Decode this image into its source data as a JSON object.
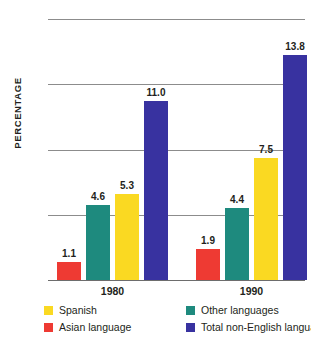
{
  "chart_data": {
    "type": "bar",
    "title": "",
    "subtitle": "",
    "xlabel": "",
    "ylabel": "PERCENTAGE",
    "ylim": [
      0,
      16
    ],
    "yticks": [
      "0",
      "4",
      "8",
      "12",
      "16"
    ],
    "grid": true,
    "legend_position": "bottom",
    "categories": [
      "1980",
      "1990"
    ],
    "series": [
      {
        "name": "Asian language",
        "color": "#ee3a33",
        "values": [
          1.1,
          1.9
        ],
        "labels": [
          "1.1",
          "1.9"
        ]
      },
      {
        "name": "Other languages",
        "color": "#1e8a7e",
        "values": [
          4.6,
          4.4
        ],
        "labels": [
          "4.6",
          "4.4"
        ]
      },
      {
        "name": "Spanish",
        "color": "#fad922",
        "values": [
          5.3,
          7.5
        ],
        "labels": [
          "5.3",
          "7.5"
        ]
      },
      {
        "name": "Total non-English language",
        "color": "#3832a0",
        "values": [
          11.0,
          13.8
        ],
        "labels": [
          "11.0",
          "13.8"
        ]
      }
    ]
  },
  "axes": {
    "y_title": "PERCENTAGE",
    "y_ticks": [
      {
        "label": "16",
        "value": 16
      },
      {
        "label": "12",
        "value": 12
      },
      {
        "label": "8",
        "value": 8
      },
      {
        "label": "4",
        "value": 4
      },
      {
        "label": "0",
        "value": 0
      }
    ],
    "x_groups": [
      {
        "label": "1980"
      },
      {
        "label": "1990"
      }
    ]
  },
  "bars": [
    {
      "group": "1980",
      "series": "Asian language",
      "value": 1.1,
      "label": "1.1",
      "color": "#ee3a33"
    },
    {
      "group": "1980",
      "series": "Other languages",
      "value": 4.6,
      "label": "4.6",
      "color": "#1e8a7e"
    },
    {
      "group": "1980",
      "series": "Spanish",
      "value": 5.3,
      "label": "5.3",
      "color": "#fad922"
    },
    {
      "group": "1980",
      "series": "Total non-English language",
      "value": 11.0,
      "label": "11.0",
      "color": "#3832a0"
    },
    {
      "group": "1990",
      "series": "Asian language",
      "value": 1.9,
      "label": "1.9",
      "color": "#ee3a33"
    },
    {
      "group": "1990",
      "series": "Other languages",
      "value": 4.4,
      "label": "4.4",
      "color": "#1e8a7e"
    },
    {
      "group": "1990",
      "series": "Spanish",
      "value": 7.5,
      "label": "7.5",
      "color": "#fad922"
    },
    {
      "group": "1990",
      "series": "Total non-English language",
      "value": 13.8,
      "label": "13.8",
      "color": "#3832a0"
    }
  ],
  "legend": {
    "items": [
      {
        "label": "Spanish",
        "color": "#fad922",
        "col": 0,
        "row": 0
      },
      {
        "label": "Asian language",
        "color": "#ee3a33",
        "col": 0,
        "row": 1
      },
      {
        "label": "Other languages",
        "color": "#1e8a7e",
        "col": 1,
        "row": 0
      },
      {
        "label": "Total non-English language",
        "color": "#3832a0",
        "col": 1,
        "row": 1
      }
    ]
  }
}
